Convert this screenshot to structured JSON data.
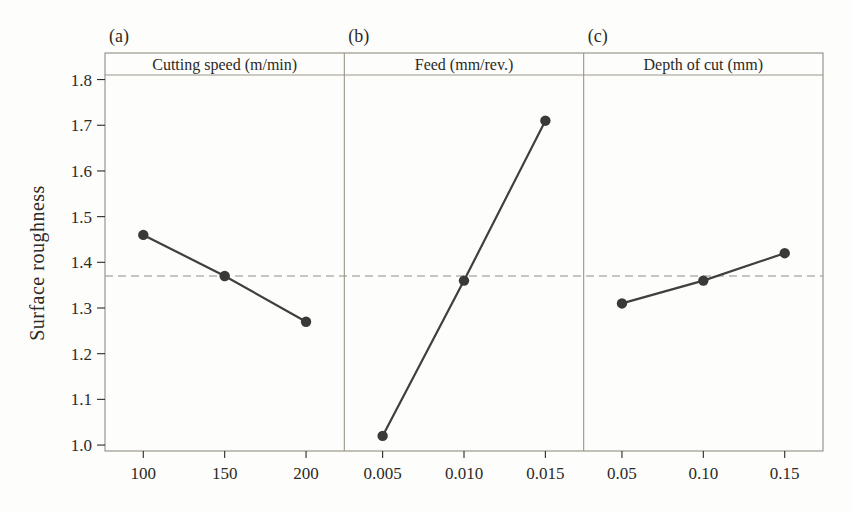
{
  "chart_data": {
    "type": "line",
    "title": "",
    "ylabel": "Surface roughness",
    "ylim": [
      0.987,
      1.81
    ],
    "yticks": [
      1.0,
      1.1,
      1.2,
      1.3,
      1.4,
      1.5,
      1.6,
      1.7,
      1.8
    ],
    "ytick_labels": [
      "1.0",
      "1.1",
      "1.2",
      "1.3",
      "1.4",
      "1.5",
      "1.6",
      "1.7",
      "1.8"
    ],
    "mean_line_value": 1.37,
    "grid": false,
    "legend": "none",
    "panels": [
      {
        "label": "(a)",
        "header": "Cutting speed (m/min)",
        "categories": [
          "100",
          "150",
          "200"
        ],
        "values": [
          1.46,
          1.37,
          1.27
        ]
      },
      {
        "label": "(b)",
        "header": "Feed (mm/rev.)",
        "categories": [
          "0.005",
          "0.010",
          "0.015"
        ],
        "values": [
          1.02,
          1.36,
          1.71
        ]
      },
      {
        "label": "(c)",
        "header": "Depth of cut (mm)",
        "categories": [
          "0.05",
          "0.10",
          "0.15"
        ],
        "values": [
          1.31,
          1.36,
          1.42
        ]
      }
    ],
    "colors": {
      "series_line": "#403f3b",
      "marker": "#3a3936",
      "panel_border": "#9c978b",
      "mean_line": "#b5b3ae",
      "text": "#2b2a26",
      "background": "#fdfdfb"
    }
  }
}
